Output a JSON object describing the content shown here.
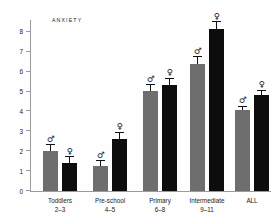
{
  "chart_data": {
    "type": "bar",
    "title": "ANXIETY",
    "xlabel": "",
    "ylabel": "",
    "ylim": [
      0,
      8.6
    ],
    "yticks": [
      0,
      1,
      2,
      3,
      4,
      5,
      6,
      7,
      8
    ],
    "ytick_labels": [
      "0",
      "1",
      "2",
      "3",
      "4",
      "5",
      "6",
      "7",
      "8"
    ],
    "grid": false,
    "legend": "none",
    "categories": [
      "Toddlers 2–3",
      "Pre-school 4–5",
      "Primary 6–8",
      "Intermediate 9–11",
      "ALL"
    ],
    "category_lines": [
      {
        "line1": "Toddlers",
        "line2": "2–3"
      },
      {
        "line1": "Pre-school",
        "line2": "4–5"
      },
      {
        "line1": "Primary",
        "line2": "6–8"
      },
      {
        "line1": "Intermediate",
        "line2": "9–11"
      },
      {
        "line1": "ALL",
        "line2": ""
      }
    ],
    "series": [
      {
        "name": "Male",
        "symbol": "♂",
        "color": "#6e6e6e",
        "values": [
          2.0,
          1.28,
          5.05,
          6.4,
          4.05
        ],
        "errors": [
          0.3,
          0.22,
          0.28,
          0.33,
          0.2
        ]
      },
      {
        "name": "Female",
        "symbol": "♀",
        "color": "#0d0d0d",
        "values": [
          1.42,
          2.62,
          5.35,
          8.15,
          4.82
        ],
        "errors": [
          0.28,
          0.3,
          0.3,
          0.33,
          0.22
        ]
      }
    ]
  },
  "colors": {
    "male_bar": "#6e6e6e",
    "female_bar": "#0d0d0d",
    "axis": "#9a9a9a",
    "text": "#1a1a1a",
    "background": "#fefefe"
  }
}
